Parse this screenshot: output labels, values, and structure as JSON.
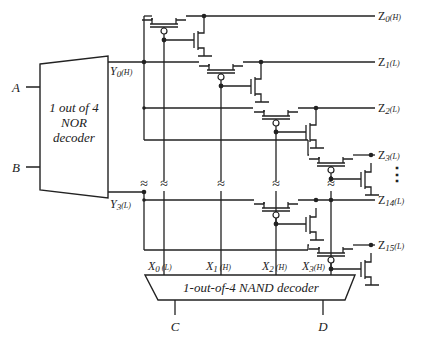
{
  "nor_decoder": {
    "line1": "1 out of 4",
    "line2": "NOR",
    "line3": "decoder",
    "inputs": [
      "A",
      "B"
    ],
    "outputs": [
      {
        "name": "Y",
        "sub": "0",
        "pol": "(H)"
      },
      {
        "name": "Y",
        "sub": "3",
        "pol": "(L)"
      }
    ]
  },
  "nand_decoder": {
    "label": "1-out-of-4  NAND decoder",
    "inputs": [
      "C",
      "D"
    ],
    "outputs": [
      {
        "name": "X",
        "sub": "0",
        "pol": "(L)"
      },
      {
        "name": "X",
        "sub": "1",
        "pol": "(H)"
      },
      {
        "name": "X",
        "sub": "2",
        "pol": "(H)"
      },
      {
        "name": "X",
        "sub": "3",
        "pol": "(H)"
      }
    ]
  },
  "z_outputs": [
    {
      "name": "Z",
      "sub": "0",
      "pol": "(H)"
    },
    {
      "name": "Z",
      "sub": "1",
      "pol": "(L)"
    },
    {
      "name": "Z",
      "sub": "2",
      "pol": "(L)"
    },
    {
      "name": "Z",
      "sub": "3",
      "pol": "(L)"
    },
    {
      "name": "Z",
      "sub": "14",
      "pol": "(L)"
    },
    {
      "name": "Z",
      "sub": "15",
      "pol": "(L)"
    }
  ],
  "ellipsis": "⋮",
  "break_symbol": "≈"
}
